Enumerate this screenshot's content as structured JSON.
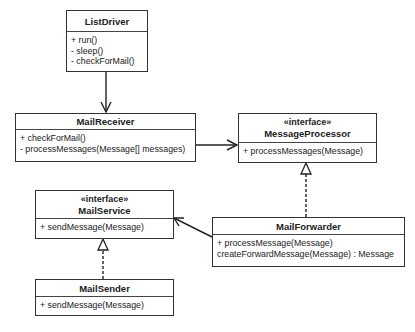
{
  "classes": {
    "list_driver": {
      "name": "ListDriver",
      "methods": [
        "+ run()",
        "- sleep()",
        "- checkForMail()"
      ]
    },
    "mail_receiver": {
      "name": "MailReceiver",
      "methods": [
        "+ checkForMail()",
        "- processMessages(Message[] messages)"
      ]
    },
    "message_processor": {
      "stereotype": "«interface»",
      "name": "MessageProcessor",
      "methods": [
        "+ processMessages(Message)"
      ]
    },
    "mail_service": {
      "stereotype": "«interface»",
      "name": "MailService",
      "methods": [
        "+ sendMessage(Message)"
      ]
    },
    "mail_forwarder": {
      "name": "MailForwarder",
      "methods": [
        "+ processMessage(Message)",
        "createForwardMessage(Message) : Message"
      ]
    },
    "mail_sender": {
      "name": "MailSender",
      "methods": [
        "+ sendMessage(Message)"
      ]
    }
  },
  "relationships": [
    {
      "from": "ListDriver",
      "to": "MailReceiver",
      "type": "association"
    },
    {
      "from": "MailReceiver",
      "to": "MessageProcessor",
      "type": "association"
    },
    {
      "from": "MailForwarder",
      "to": "MessageProcessor",
      "type": "realization"
    },
    {
      "from": "MailForwarder",
      "to": "MailService",
      "type": "association"
    },
    {
      "from": "MailSender",
      "to": "MailService",
      "type": "realization"
    }
  ]
}
